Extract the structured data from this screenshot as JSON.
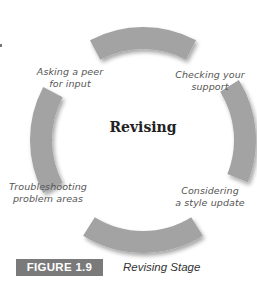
{
  "diagram": {
    "title": "Revising",
    "center": {
      "x": 143,
      "y": 140
    },
    "outer_radius": 113,
    "inner_radius": 91,
    "arc_color": "#a3a3a3",
    "segments": [
      {
        "label": "Asking a peer for input",
        "lines": [
          "Asking a peer",
          "for input"
        ]
      },
      {
        "label": "Checking your support",
        "lines": [
          "Checking your",
          "support"
        ]
      },
      {
        "label": "Considering a style update",
        "lines": [
          "Considering",
          "a style update"
        ]
      },
      {
        "label": "Troubleshooting problem areas",
        "lines": [
          "Troubleshooting",
          "problem areas"
        ]
      }
    ]
  },
  "figure": {
    "number": "FIGURE 1.9",
    "caption": "Revising Stage",
    "badge_color": "#7a7a7a"
  }
}
